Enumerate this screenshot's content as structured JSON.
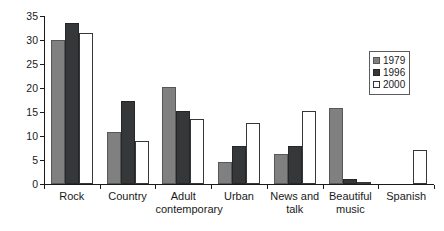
{
  "chart_data": {
    "type": "bar",
    "title": "",
    "subtitle": "",
    "xlabel": "",
    "ylabel": "",
    "ylim": [
      0,
      35
    ],
    "yticks": [
      0,
      5,
      10,
      15,
      20,
      25,
      30,
      35
    ],
    "ytick_labels": [
      "0",
      "5",
      "10",
      "15",
      "20",
      "25",
      "30",
      "35"
    ],
    "grid": false,
    "legend_position": "top-right",
    "categories": [
      "Rock",
      "Country",
      "Adult\ncontemporary",
      "Urban",
      "News and\ntalk",
      "Beautiful\nmusic",
      "Spanish"
    ],
    "series": [
      {
        "name": "1979",
        "color": "#808080",
        "values": [
          30.0,
          10.8,
          20.2,
          4.5,
          6.3,
          15.8,
          0
        ]
      },
      {
        "name": "1996",
        "color": "#353739",
        "values": [
          33.5,
          17.3,
          15.3,
          8.0,
          8.0,
          1.0,
          0
        ]
      },
      {
        "name": "2000",
        "color": "#ffffff",
        "values": [
          31.5,
          9.0,
          13.5,
          12.7,
          15.3,
          0.3,
          7.0
        ]
      }
    ]
  },
  "legend": {
    "entries": [
      {
        "label": "1979",
        "swatch": "s1979"
      },
      {
        "label": "1996",
        "swatch": "s1996"
      },
      {
        "label": "2000",
        "swatch": "s2000"
      }
    ]
  }
}
